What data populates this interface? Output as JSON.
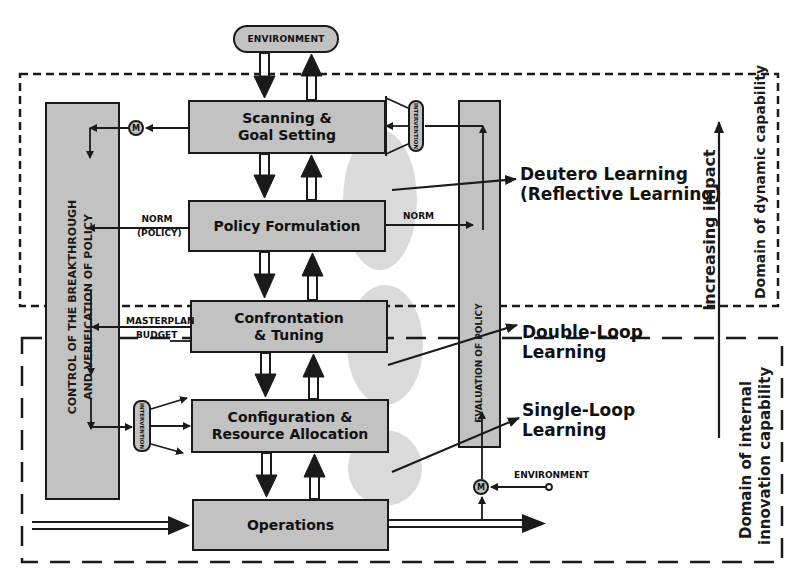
{
  "diagram": {
    "type": "process-flow / learning-loops",
    "environment_top": "ENVIRONMENT",
    "environment_bottom": "ENVIRONMENT",
    "stages": [
      {
        "id": "scanning",
        "label": "Scanning &\nGoal Setting"
      },
      {
        "id": "policy",
        "label": "Policy Formulation"
      },
      {
        "id": "confrontation",
        "label": "Confrontation\n& Tuning"
      },
      {
        "id": "configuration",
        "label": "Configuration &\nResource Allocation"
      },
      {
        "id": "operations",
        "label": "Operations"
      }
    ],
    "control_column": {
      "label_line1": "CONTROL OF THE BREAKTHROUGH",
      "label_line2": "AND VERIFICATION OF POLICY"
    },
    "evaluation_column": {
      "label": "EVALUATION OF POLICY"
    },
    "intervention_label": "INTERVENTION",
    "monitor_label": "M",
    "flow_labels": {
      "norm_policy_line1": "NORM",
      "norm_policy_line2": "(POLICY)",
      "norm_right": "NORM",
      "masterplan": "MASTERPLAN",
      "budget": "BUDGET"
    },
    "learning_types": [
      {
        "line1": "Deutero Learning",
        "line2": "(Reflective Learning)"
      },
      {
        "line1": "Double-Loop",
        "line2": "Learning"
      },
      {
        "line1": "Single-Loop",
        "line2": "Learning"
      }
    ],
    "impact_axis_label": "Increasing impact",
    "domains": {
      "dynamic": "Domain of dynamic capability",
      "internal_line1": "Domain of internal",
      "internal_line2": "innovation capability"
    },
    "colors": {
      "box_fill": "#c2c2c2",
      "ellipse_fill": "#dadada",
      "stroke": "#1a1a1a"
    }
  }
}
